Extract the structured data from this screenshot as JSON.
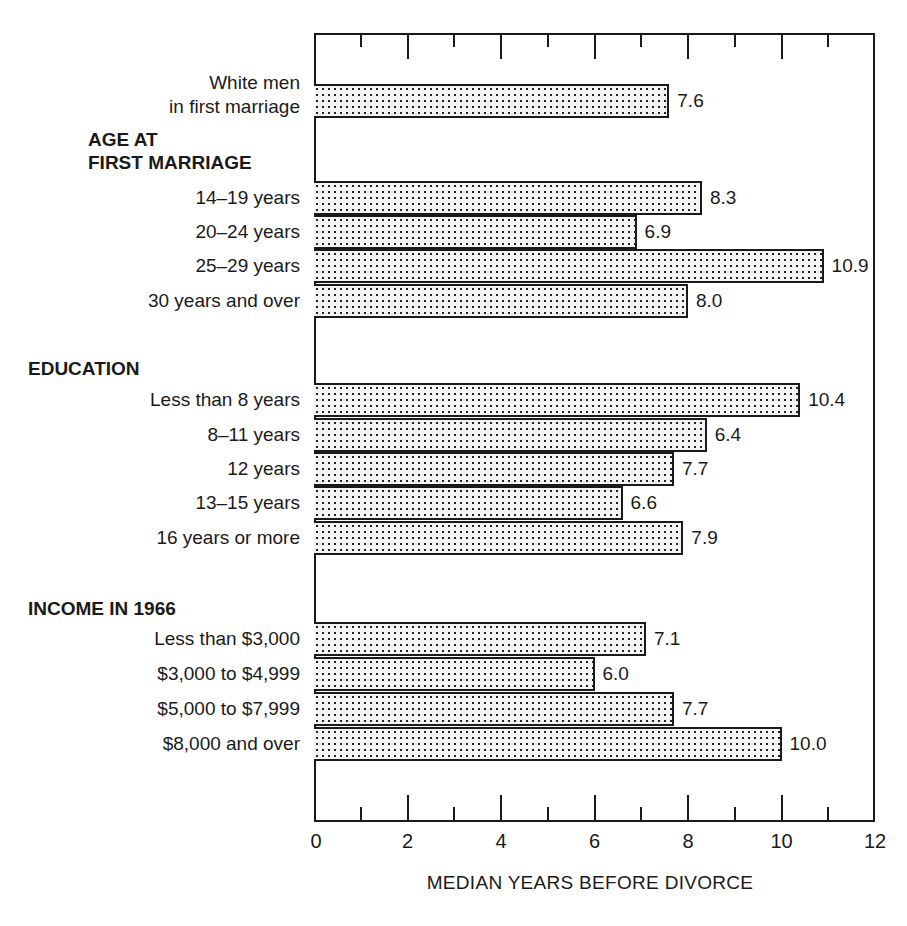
{
  "chart_data": {
    "type": "bar",
    "orientation": "horizontal",
    "title": "",
    "xlabel": "MEDIAN YEARS BEFORE DIVORCE",
    "ylabel": "",
    "xlim": [
      0,
      12
    ],
    "xticks": [
      0,
      2,
      4,
      6,
      8,
      10,
      12
    ],
    "minor_xticks": [
      1,
      3,
      5,
      7,
      9,
      11
    ],
    "grid": false,
    "legend": null,
    "groups": [
      {
        "name": "",
        "items": [
          {
            "label": "White men\nin first marriage",
            "value": 7.6,
            "value_label": "7.6"
          }
        ]
      },
      {
        "name": "AGE AT\nFIRST MARRIAGE",
        "items": [
          {
            "label": "14–19 years",
            "value": 8.3,
            "value_label": "8.3"
          },
          {
            "label": "20–24 years",
            "value": 6.9,
            "value_label": "6.9"
          },
          {
            "label": "25–29 years",
            "value": 10.9,
            "value_label": "10.9"
          },
          {
            "label": "30 years and over",
            "value": 8.0,
            "value_label": "8.0"
          }
        ]
      },
      {
        "name": "EDUCATION",
        "items": [
          {
            "label": "Less than 8 years",
            "value": 10.4,
            "value_label": "10.4"
          },
          {
            "label": "8–11 years",
            "value": 6.4,
            "value_label": "6.4",
            "drawn_length": 8.4
          },
          {
            "label": "12 years",
            "value": 7.7,
            "value_label": "7.7"
          },
          {
            "label": "13–15 years",
            "value": 6.6,
            "value_label": "6.6"
          },
          {
            "label": "16 years or more",
            "value": 7.9,
            "value_label": "7.9"
          }
        ]
      },
      {
        "name": "INCOME IN 1966",
        "items": [
          {
            "label": "Less than $3,000",
            "value": 7.1,
            "value_label": "7.1"
          },
          {
            "label": "$3,000 to $4,999",
            "value": 6.0,
            "value_label": "6.0"
          },
          {
            "label": "$5,000 to $7,999",
            "value": 7.7,
            "value_label": "7.7"
          },
          {
            "label": "$8,000 and over",
            "value": 10.0,
            "value_label": "10.0"
          }
        ]
      }
    ],
    "categories": [
      "White men in first marriage",
      "14–19 years",
      "20–24 years",
      "25–29 years",
      "30 years and over",
      "Less than 8 years",
      "8–11 years",
      "12 years",
      "13–15 years",
      "16 years or more",
      "Less than $3,000",
      "$3,000 to $4,999",
      "$5,000 to $7,999",
      "$8,000 and over"
    ],
    "values": [
      7.6,
      8.3,
      6.9,
      10.9,
      8.0,
      10.4,
      6.4,
      7.7,
      6.6,
      7.9,
      7.1,
      6.0,
      7.7,
      10.0
    ]
  },
  "labels": {
    "white_men": "White men\nin first marriage",
    "white_men_line1": "White men",
    "white_men_line2": "in first marriage",
    "age_group": "AGE AT\nFIRST MARRIAGE",
    "education_group": "EDUCATION",
    "income_group": "INCOME IN 1966",
    "xlabel": "MEDIAN YEARS BEFORE DIVORCE"
  },
  "colors": {
    "ink": "#1a1a1a",
    "background": "#ffffff",
    "bar_fill": "#f4f4f4"
  }
}
